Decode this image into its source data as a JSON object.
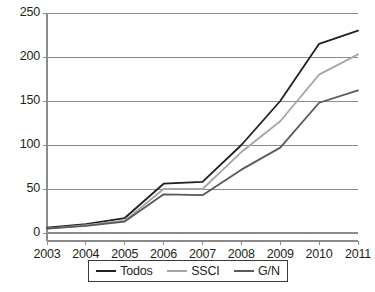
{
  "chart_data": {
    "type": "line",
    "title": "",
    "xlabel": "",
    "ylabel": "",
    "categories": [
      "2003",
      "2004",
      "2005",
      "2006",
      "2007",
      "2008",
      "2009",
      "2010",
      "2011"
    ],
    "x": [
      2003,
      2004,
      2005,
      2006,
      2007,
      2008,
      2009,
      2010,
      2011
    ],
    "ylim": [
      0,
      250
    ],
    "xlim": [
      2003,
      2011
    ],
    "yticks": [
      0,
      50,
      100,
      150,
      200,
      250
    ],
    "ytick_labels": [
      "0",
      "50",
      "100",
      "150",
      "200",
      "250"
    ],
    "grid": "horizontal",
    "legend_position": "bottom",
    "series": [
      {
        "name": "Todos",
        "color": "#231f20",
        "values": [
          6,
          10,
          17,
          56,
          58,
          100,
          150,
          215,
          230
        ]
      },
      {
        "name": "SSCI",
        "color": "#a6a6a6",
        "values": [
          5,
          9,
          14,
          50,
          50,
          92,
          127,
          180,
          203
        ]
      },
      {
        "name": "G/N",
        "color": "#58595b",
        "values": [
          5,
          8,
          13,
          44,
          43,
          72,
          97,
          148,
          162
        ]
      }
    ]
  },
  "legend": {
    "entries": [
      {
        "label": "Todos"
      },
      {
        "label": "SSCI"
      },
      {
        "label": "G/N"
      }
    ]
  }
}
